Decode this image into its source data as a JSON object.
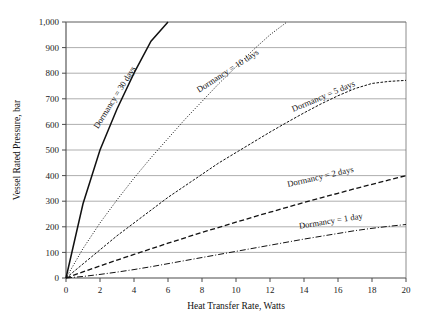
{
  "chart_data": {
    "type": "line",
    "title": "",
    "xlabel": "Heat Transfer Rate, Watts",
    "ylabel": "Vessel Rated Pressure, bar",
    "xlim": [
      0,
      20
    ],
    "ylim": [
      0,
      1000
    ],
    "xticks": [
      "0",
      "2",
      "4",
      "6",
      "8",
      "10",
      "12",
      "14",
      "16",
      "18",
      "20"
    ],
    "yticks": [
      "0",
      "100",
      "200",
      "300",
      "400",
      "500",
      "600",
      "700",
      "800",
      "900",
      "1,000"
    ],
    "grid": "horizontal",
    "legend_position": "inline-curve-labels",
    "x": [
      0,
      1,
      2,
      3,
      4,
      5,
      6,
      7,
      8,
      9,
      10,
      11,
      12,
      13,
      14,
      15,
      16,
      17,
      18,
      19,
      20
    ],
    "series": [
      {
        "name": "Dormancy = 30 days",
        "label": "Dormancy = 30 days",
        "style": "solid",
        "label_x": 3.0,
        "label_y": 700,
        "label_angle": -58,
        "values": [
          0,
          290,
          500,
          660,
          800,
          925,
          1000,
          null,
          null,
          null,
          null,
          null,
          null,
          null,
          null,
          null,
          null,
          null,
          null,
          null,
          null
        ]
      },
      {
        "name": "Dormancy = 10 days",
        "label": "Dormancy = 10 days",
        "style": "dotted",
        "label_x": 9.6,
        "label_y": 800,
        "label_angle": -33,
        "values": [
          0,
          115,
          215,
          305,
          390,
          470,
          545,
          620,
          690,
          760,
          825,
          890,
          950,
          1000,
          null,
          null,
          null,
          null,
          null,
          null,
          null
        ]
      },
      {
        "name": "Dormancy = 5 days",
        "label": "Dormancy = 5 days",
        "style": "dash-dot-fine",
        "label_x": 15.2,
        "label_y": 700,
        "label_angle": -23,
        "values": [
          0,
          55,
          110,
          165,
          215,
          265,
          315,
          360,
          405,
          450,
          490,
          530,
          570,
          608,
          645,
          680,
          712,
          740,
          760,
          768,
          772
        ]
      },
      {
        "name": "Dormancy = 2 days",
        "label": "Dormancy = 2 days",
        "style": "dashed",
        "label_x": 15.0,
        "label_y": 385,
        "label_angle": -13,
        "values": [
          0,
          24,
          47,
          70,
          92,
          114,
          136,
          157,
          178,
          198,
          218,
          238,
          257,
          276,
          295,
          313,
          331,
          349,
          366,
          383,
          400
        ]
      },
      {
        "name": "Dormancy = 1 day",
        "label": "Dormancy = 1 day",
        "style": "dash-dot",
        "label_x": 15.6,
        "label_y": 212,
        "label_angle": -9,
        "values": [
          0,
          6,
          14,
          23,
          33,
          44,
          56,
          68,
          80,
          92,
          104,
          116,
          128,
          140,
          152,
          163,
          174,
          185,
          194,
          202,
          209
        ]
      }
    ]
  }
}
